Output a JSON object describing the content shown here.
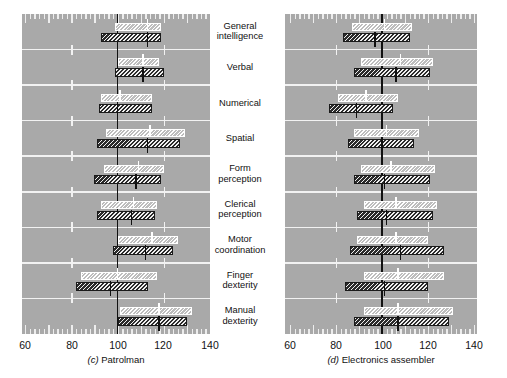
{
  "figure": {
    "categories": [
      "General\nintelligence",
      "Verbal",
      "Numerical",
      "Spatial",
      "Form\nperception",
      "Clerical\nperception",
      "Motor\ncoordination",
      "Finger\ndexterity",
      "Manual\ndexterity"
    ],
    "axis_ticks": [
      "60",
      "80",
      "100",
      "120",
      "140"
    ],
    "reference_value": 100,
    "panels": [
      {
        "key": "patrolman",
        "caption_letter": "(c)",
        "caption_text": "Patrolman"
      },
      {
        "key": "electronics",
        "caption_letter": "(d)",
        "caption_text": "Electronics assembler"
      }
    ]
  },
  "chart_data": {
    "type": "bar",
    "title": "",
    "subtitle": "",
    "xlabel": "",
    "ylabel": "",
    "xlim": [
      60,
      140
    ],
    "grid": true,
    "legend_position": "none",
    "orientation": "horizontal",
    "annotations": [
      "Each category shows two horizontal range bars: an upper light hatched bar and a lower dark hatched bar, each marked with a median tick.",
      "A heavy vertical reference line is drawn at 100 in both panels."
    ],
    "categories": [
      "General intelligence",
      "Verbal",
      "Numerical",
      "Spatial",
      "Form perception",
      "Clerical perception",
      "Motor coordination",
      "Finger dexterity",
      "Manual dexterity"
    ],
    "panels": [
      {
        "name": "(c) Patrolman",
        "series": [
          {
            "name": "light-range",
            "style": "light-hatched",
            "ranges": [
              [
                99,
                119
              ],
              [
                100,
                118
              ],
              [
                93,
                115
              ],
              [
                95,
                129
              ],
              [
                94,
                120
              ],
              [
                93,
                117
              ],
              [
                100,
                126
              ],
              [
                84,
                117
              ],
              [
                101,
                132
              ]
            ],
            "medians": [
              113,
              111,
              101,
              114,
              109,
              107,
              115,
              100,
              118
            ]
          },
          {
            "name": "dark-range",
            "style": "dark-hatched",
            "ranges": [
              [
                93,
                119
              ],
              [
                99,
                120
              ],
              [
                92,
                115
              ],
              [
                91,
                127
              ],
              [
                90,
                119
              ],
              [
                91,
                116
              ],
              [
                98,
                124
              ],
              [
                82,
                113
              ],
              [
                100,
                130
              ]
            ],
            "medians": [
              113,
              111,
              100,
              113,
              108,
              106,
              112,
              97,
              118
            ]
          }
        ]
      },
      {
        "name": "(d) Electronics assembler",
        "series": [
          {
            "name": "light-range",
            "style": "light-hatched",
            "ranges": [
              [
                87,
                113
              ],
              [
                91,
                122
              ],
              [
                81,
                107
              ],
              [
                88,
                116
              ],
              [
                91,
                123
              ],
              [
                92,
                124
              ],
              [
                89,
                120
              ],
              [
                92,
                127
              ],
              [
                92,
                131
              ]
            ],
            "medians": [
              101,
              108,
              93,
              102,
              104,
              106,
              106,
              107,
              107
            ]
          },
          {
            "name": "dark-range",
            "style": "dark-hatched",
            "ranges": [
              [
                83,
                112
              ],
              [
                88,
                121
              ],
              [
                77,
                105
              ],
              [
                85,
                114
              ],
              [
                88,
                121
              ],
              [
                89,
                122
              ],
              [
                86,
                127
              ],
              [
                84,
                120
              ],
              [
                88,
                129
              ]
            ],
            "medians": [
              97,
              106,
              89,
              100,
              101,
              102,
              108,
              101,
              107
            ]
          }
        ]
      }
    ]
  }
}
